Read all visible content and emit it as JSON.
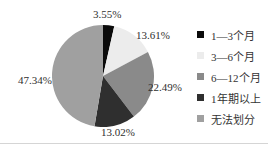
{
  "chart_data": {
    "type": "pie",
    "title": "",
    "legend_position": "right",
    "start_angle_deg": -90,
    "direction": "clockwise",
    "slices": [
      {
        "label": "1—3个月",
        "value": 3.55,
        "display": "3.55%",
        "color": "#0b0b0b"
      },
      {
        "label": "3—6个月",
        "value": 13.61,
        "display": "13.61%",
        "color": "#ececec"
      },
      {
        "label": "6—12个月",
        "value": 22.49,
        "display": "22.49%",
        "color": "#8a8a8a"
      },
      {
        "label": "1年期以上",
        "value": 13.02,
        "display": "13.02%",
        "color": "#2f2f2f"
      },
      {
        "label": "无法划分",
        "value": 47.34,
        "display": "47.34%",
        "color": "#a0a0a0"
      }
    ]
  }
}
